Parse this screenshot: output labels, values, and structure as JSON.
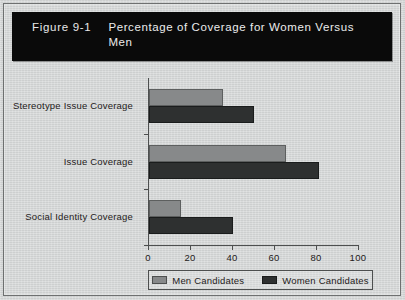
{
  "figure": {
    "number": "Figure 9-1",
    "title": "Percentage of Coverage for Women Versus Men"
  },
  "chart_data": {
    "type": "bar",
    "orientation": "horizontal",
    "title": "Percentage of Coverage for Women Versus Men",
    "categories": [
      "Stereotype Issue Coverage",
      "Issue Coverage",
      "Social Identity Coverage"
    ],
    "series": [
      {
        "name": "Men Candidates",
        "color": "#87898a",
        "values": [
          35,
          65,
          15
        ]
      },
      {
        "name": "Women Candidates",
        "color": "#2e3030",
        "values": [
          50,
          81,
          40
        ]
      }
    ],
    "xlabel": "",
    "ylabel": "",
    "xlim": [
      0,
      100
    ],
    "xticks": [
      0,
      20,
      40,
      60,
      80,
      100
    ],
    "grid": false,
    "legend_position": "bottom"
  },
  "legend": {
    "entries": [
      {
        "label": "Men Candidates"
      },
      {
        "label": "Women Candidates"
      }
    ]
  }
}
